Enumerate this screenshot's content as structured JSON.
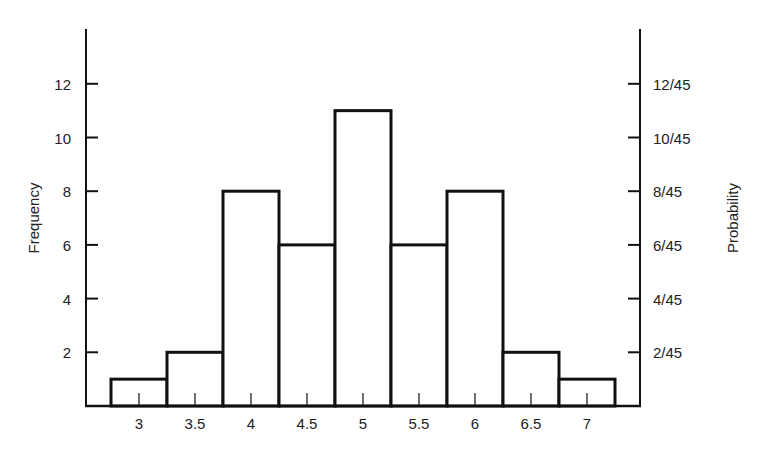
{
  "chart_data": {
    "type": "bar",
    "subtype": "histogram",
    "title": "",
    "xlabel": "",
    "ylabel": "Frequency",
    "ylabel_right": "Probability",
    "categories": [
      "3",
      "3.5",
      "4",
      "4.5",
      "5",
      "5.5",
      "6",
      "6.5",
      "7"
    ],
    "x": [
      3,
      3.5,
      4,
      4.5,
      5,
      5.5,
      6,
      6.5,
      7
    ],
    "values": [
      1,
      2,
      8,
      6,
      11,
      6,
      8,
      2,
      1
    ],
    "probabilities": [
      "1/45",
      "2/45",
      "8/45",
      "6/45",
      "11/45",
      "6/45",
      "8/45",
      "2/45",
      "1/45"
    ],
    "total": 45,
    "ylim": [
      0,
      14
    ],
    "left_ticks": [
      "2",
      "4",
      "6",
      "8",
      "10",
      "12"
    ],
    "left_tick_values": [
      2,
      4,
      6,
      8,
      10,
      12
    ],
    "right_ticks": [
      "2/45",
      "4/45",
      "6/45",
      "8/45",
      "10/45",
      "12/45"
    ],
    "grid": false,
    "legend": null,
    "bar_fill": "#ffffff",
    "bar_stroke": "#111111"
  }
}
